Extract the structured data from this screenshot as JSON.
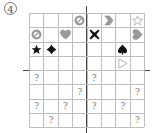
{
  "puzzle": {
    "number_label": "4",
    "rows": 8,
    "cols": 8,
    "colors": {
      "grid_line": "#bdbdbd",
      "axis": "#444444",
      "gray_shape": "#9a9a9a",
      "black_shape": "#111111"
    },
    "cells": [
      {
        "row": 0,
        "col": 3,
        "icon": "no-sign-icon",
        "fill": "gray"
      },
      {
        "row": 0,
        "col": 5,
        "icon": "chevron-right-icon",
        "fill": "gray"
      },
      {
        "row": 0,
        "col": 7,
        "icon": "star-outline-icon",
        "fill": "white"
      },
      {
        "row": 1,
        "col": 0,
        "icon": "no-sign-icon",
        "fill": "gray"
      },
      {
        "row": 1,
        "col": 2,
        "icon": "heart-icon",
        "fill": "gray"
      },
      {
        "row": 1,
        "col": 4,
        "icon": "cross-icon",
        "fill": "black"
      },
      {
        "row": 1,
        "col": 7,
        "icon": "heart-rotated-icon",
        "fill": "gray"
      },
      {
        "row": 2,
        "col": 0,
        "icon": "star-icon",
        "fill": "black"
      },
      {
        "row": 2,
        "col": 1,
        "icon": "diamond-icon",
        "fill": "black"
      },
      {
        "row": 2,
        "col": 6,
        "icon": "spade-icon",
        "fill": "black"
      },
      {
        "row": 3,
        "col": 6,
        "icon": "triangle-right-outline-icon",
        "fill": "white"
      },
      {
        "row": 4,
        "col": 0,
        "text": "?"
      },
      {
        "row": 4,
        "col": 4,
        "text": "?"
      },
      {
        "row": 5,
        "col": 3,
        "text": "?"
      },
      {
        "row": 5,
        "col": 7,
        "text": "?"
      },
      {
        "row": 6,
        "col": 0,
        "text": "?"
      },
      {
        "row": 6,
        "col": 2,
        "text": "?"
      },
      {
        "row": 6,
        "col": 4,
        "text": "?"
      },
      {
        "row": 6,
        "col": 6,
        "text": "?"
      },
      {
        "row": 7,
        "col": 1,
        "text": "?"
      },
      {
        "row": 7,
        "col": 7,
        "text": "?"
      }
    ]
  }
}
